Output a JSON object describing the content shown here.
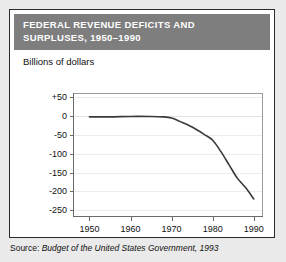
{
  "figure": {
    "title_line1": "FEDERAL REVENUE DEFICITS AND",
    "title_line2": "SURPLUSES, 1950–1990",
    "title_bg_color": "#7e7e7e",
    "title_text_color": "#ffffff",
    "panel_border_color": "#2b2b2b",
    "background_color": "#eaeaea"
  },
  "source": {
    "label": "Source: ",
    "reference": "Budget of the United States Government, 1993"
  },
  "chart_data": {
    "type": "line",
    "title": "FEDERAL REVENUE DEFICITS AND SURPLUSES, 1950–1990",
    "subtitle": "",
    "ylabel": "Billions of dollars",
    "xlabel": "",
    "grid": true,
    "legend": "none",
    "line_color": "#3a3a3a",
    "xlim": [
      1946,
      1992
    ],
    "ylim": [
      -265,
      60
    ],
    "xticks": [
      1950,
      1960,
      1970,
      1980,
      1990
    ],
    "xtick_labels": [
      "1950",
      "1960",
      "1970",
      "1980",
      "1990"
    ],
    "yticks": [
      50,
      0,
      -50,
      -100,
      -150,
      -200,
      -250
    ],
    "ytick_labels": [
      "+50",
      "0",
      "-50",
      "-100",
      "-150",
      "-200",
      "-250"
    ],
    "series": [
      {
        "name": "Federal surplus or deficit",
        "x": [
          1950,
          1955,
          1960,
          1965,
          1968,
          1970,
          1972,
          1975,
          1978,
          1980,
          1982,
          1984,
          1986,
          1988,
          1990
        ],
        "values": [
          -3,
          -3,
          -2,
          -2,
          -3,
          -6,
          -15,
          -30,
          -50,
          -65,
          -95,
          -130,
          -165,
          -190,
          -220
        ]
      }
    ]
  }
}
